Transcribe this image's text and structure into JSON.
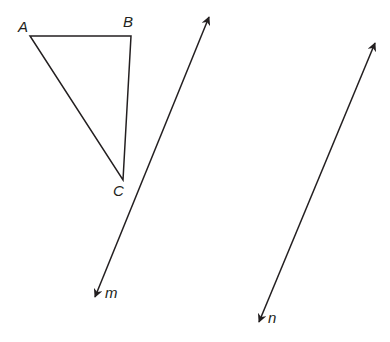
{
  "diagram": {
    "triangle": {
      "vertices": [
        {
          "name": "A",
          "x": 30,
          "y": 36,
          "label": "A",
          "lx": 18,
          "ly": 32
        },
        {
          "name": "B",
          "x": 131,
          "y": 36,
          "label": "B",
          "lx": 123,
          "ly": 27
        },
        {
          "name": "C",
          "x": 123,
          "y": 180,
          "label": "C",
          "lx": 113,
          "ly": 196
        }
      ]
    },
    "lines": [
      {
        "name": "m",
        "label": "m",
        "x1": 209,
        "y1": 17,
        "x2": 95,
        "y2": 297,
        "lx": 105,
        "ly": 298
      },
      {
        "name": "n",
        "label": "n",
        "x1": 375,
        "y1": 43,
        "x2": 259,
        "y2": 322,
        "lx": 268,
        "ly": 323
      }
    ],
    "stroke_color": "#231f20"
  }
}
